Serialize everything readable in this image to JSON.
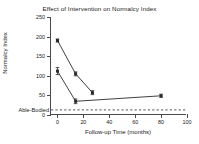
{
  "chart_data": {
    "type": "line",
    "title": "Effect of Intervention on Normalcy Index",
    "xlabel": "Follow-up Time (months)",
    "ylabel": "Normalcy Index",
    "xlim": [
      -5,
      100
    ],
    "ylim": [
      0,
      250
    ],
    "xticks": [
      0,
      20,
      40,
      60,
      80,
      100
    ],
    "yticks": [
      0,
      50,
      100,
      150,
      200,
      250
    ],
    "xticklabels": [
      "0",
      "20",
      "40",
      "60",
      "80",
      "100"
    ],
    "yticklabels": [
      "0",
      "50",
      "100",
      "150",
      "200",
      "250"
    ],
    "grid": false,
    "legend": "none",
    "marker": "square",
    "series": [
      {
        "name": "upper-group",
        "x": [
          0,
          14,
          27
        ],
        "values": [
          190,
          105,
          57
        ],
        "errors": [
          4,
          5,
          5
        ],
        "color": "#2b2b2b"
      },
      {
        "name": "lower-group",
        "x": [
          0,
          14,
          80
        ],
        "values": [
          112,
          35,
          49
        ],
        "errors": [
          9,
          6,
          4
        ],
        "color": "#2b2b2b"
      }
    ],
    "reference_line": {
      "label": "Able-Bodied",
      "value": 13,
      "style": "dashed",
      "color": "#555555"
    }
  }
}
